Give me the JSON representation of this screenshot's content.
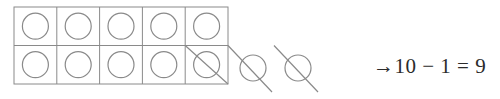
{
  "figure": {
    "grid": {
      "name": "ten-frame",
      "columns": 5,
      "rows": 2,
      "total_cells": 10,
      "x": 14,
      "y": 7,
      "cell_width": 42.8,
      "cell_height": 38.5,
      "line_color": "#8a8a8a",
      "line_width": 1
    },
    "counters": {
      "shape": "circle",
      "radius": 13,
      "stroke_color": "#8a8a8a",
      "stroke_width": 1.2,
      "inside_count": 10,
      "outside_count": 2,
      "crossed_out_inside": [
        {
          "row": 1,
          "column": 4
        }
      ],
      "outside_positions": [
        {
          "cx": 253,
          "cy": 68
        },
        {
          "cx": 298,
          "cy": 68
        }
      ]
    },
    "strike_lines": {
      "color": "#8a8a8a",
      "width": 1.2,
      "direction": "top-left-to-bottom-right"
    },
    "equation": {
      "arrow": "→",
      "minuend": "10",
      "operator": "−",
      "subtrahend": "1",
      "equals": "=",
      "result": "9",
      "full_text": "→10 − 1 = 9",
      "color": "#2b2b2b"
    }
  }
}
